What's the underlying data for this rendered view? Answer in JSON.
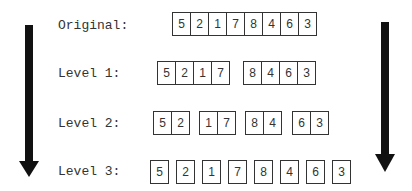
{
  "labels": {
    "original": "Original:",
    "level1": "Level 1:",
    "level2": "Level 2:",
    "level3": "Level 3:"
  },
  "rows": {
    "original": [
      [
        "5",
        "2",
        "1",
        "7",
        "8",
        "4",
        "6",
        "3"
      ]
    ],
    "level1": [
      [
        "5",
        "2",
        "1",
        "7"
      ],
      [
        "8",
        "4",
        "6",
        "3"
      ]
    ],
    "level2": [
      [
        "5",
        "2"
      ],
      [
        "1",
        "7"
      ],
      [
        "8",
        "4"
      ],
      [
        "6",
        "3"
      ]
    ],
    "level3": [
      [
        "5"
      ],
      [
        "2"
      ],
      [
        "1"
      ],
      [
        "7"
      ],
      [
        "8"
      ],
      [
        "4"
      ],
      [
        "6"
      ],
      [
        "3"
      ]
    ]
  },
  "colors": {
    "arrow": "#111111",
    "box_border": "#333333",
    "text": "#333333"
  }
}
